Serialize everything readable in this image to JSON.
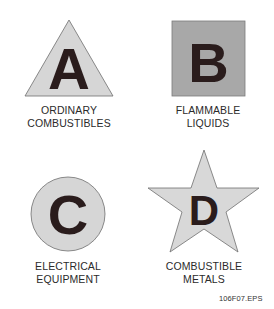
{
  "figure_id": "106F07.EPS",
  "colors": {
    "light_fill": "#d6d6d6",
    "square_fill": "#a8a8a8",
    "outline": "#6e6e6e",
    "letter": "#2a1c1c",
    "text": "#2b2b2b"
  },
  "classes": [
    {
      "letter": "A",
      "shape": "triangle",
      "line1": "ORDINARY",
      "line2": "COMBUSTIBLES"
    },
    {
      "letter": "B",
      "shape": "square",
      "line1": "FLAMMABLE",
      "line2": "LIQUIDS"
    },
    {
      "letter": "C",
      "shape": "circle",
      "line1": "ELECTRICAL",
      "line2": "EQUIPMENT"
    },
    {
      "letter": "D",
      "shape": "star",
      "line1": "COMBUSTIBLE",
      "line2": "METALS"
    }
  ]
}
